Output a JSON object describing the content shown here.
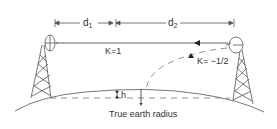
{
  "diagram": {
    "dimensions": {
      "d1": {
        "main": "d",
        "sub": "1"
      },
      "d2": {
        "main": "d",
        "sub": "2"
      }
    },
    "labels": {
      "k_straight": "K=1",
      "k_curved": "K= −1/2",
      "h": "h",
      "earth": "True earth radius"
    },
    "elements": [
      "left-tower",
      "left-dish-antenna",
      "right-tower",
      "right-dish-antenna",
      "direct-beam-line",
      "curved-beam-dashed",
      "earth-surface-arc",
      "reference-dashed-line"
    ],
    "colors": {
      "line": "#444444",
      "text": "#333333",
      "background": "#ffffff"
    }
  }
}
